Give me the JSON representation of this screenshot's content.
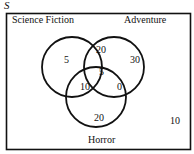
{
  "universal_set_label": "S",
  "sets": [
    {
      "name": "Science Fiction"
    },
    {
      "name": "Adventure"
    },
    {
      "name": "Horror"
    }
  ],
  "regions": {
    "science_fiction_only": "5",
    "adventure_only": "30",
    "horror_only": "20",
    "scifi_and_adventure_only": "20",
    "scifi_and_horror_only": "10",
    "adventure_and_horror_only": "0",
    "all_three": "5",
    "none": "10"
  }
}
